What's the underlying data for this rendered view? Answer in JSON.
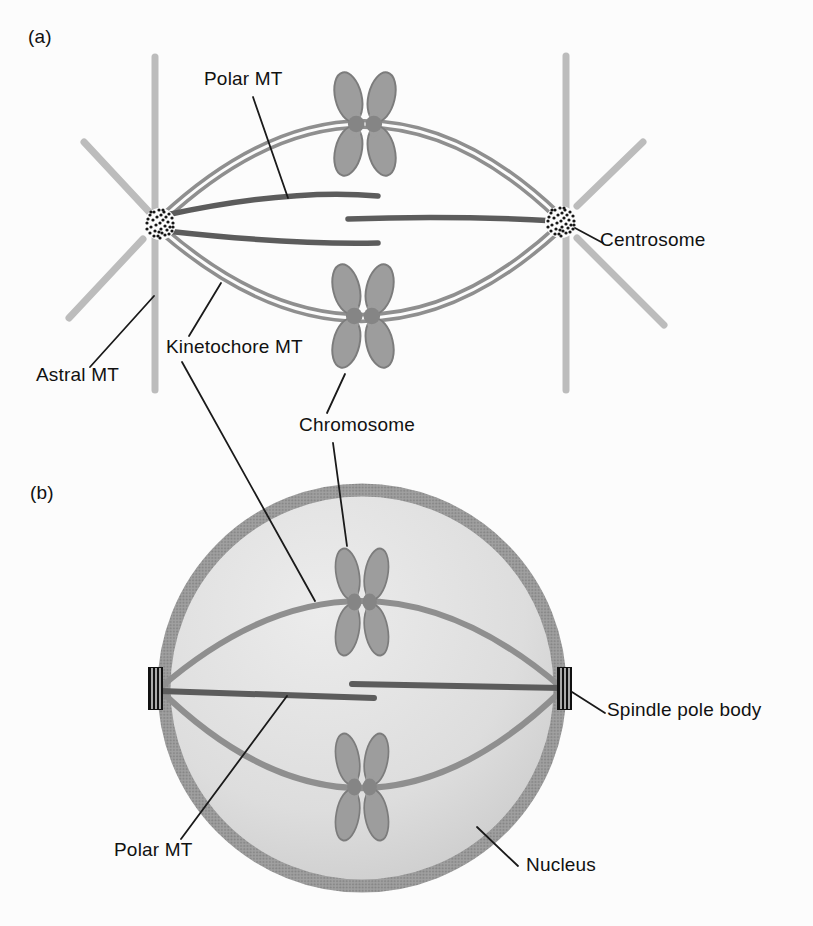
{
  "figure": {
    "panel_a": {
      "tag": "(a)",
      "labels": {
        "polar_mt": "Polar MT",
        "centrosome": "Centrosome",
        "astral_mt": "Astral MT",
        "kinetochore_mt": "Kinetochore MT",
        "chromosome": "Chromosome"
      }
    },
    "panel_b": {
      "tag": "(b)",
      "labels": {
        "spindle_pole_body": "Spindle pole body",
        "polar_mt": "Polar MT",
        "nucleus": "Nucleus"
      }
    }
  },
  "colors": {
    "background": "#fcfcfc",
    "astral_mt": "#bcbcbc",
    "kinetochore_mt": "#8f8f8f",
    "polar_mt": "#5c5c5c",
    "chromosome_fill": "#9d9d9d",
    "chromosome_stroke": "#7c7c7c",
    "centromere": "#858585",
    "nucleus_rim": "#999999",
    "nucleus_fill_light": "#ececec",
    "nucleus_fill_dark": "#c6c6c6",
    "spindle_pole_body": "#111111",
    "label_line": "#1a1a1a",
    "text": "#111111"
  }
}
